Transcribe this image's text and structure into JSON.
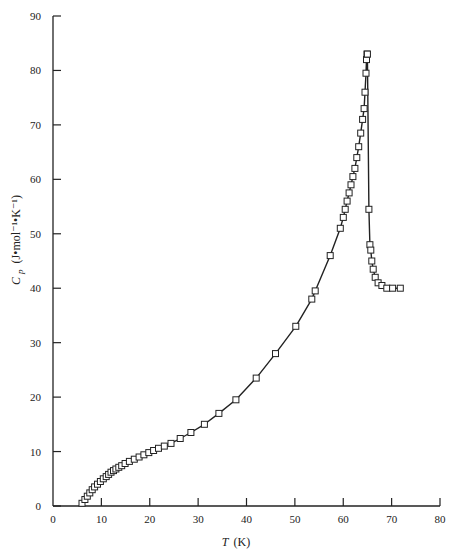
{
  "chart_data": {
    "type": "scatter",
    "title": "",
    "xlabel": "T (K)",
    "ylabel": "Cp (J•mol⁻¹•K⁻¹)",
    "xlim": [
      0,
      80
    ],
    "ylim": [
      0,
      90
    ],
    "xticks": [
      0,
      10,
      20,
      30,
      40,
      50,
      60,
      70,
      80
    ],
    "yticks": [
      0,
      10,
      20,
      30,
      40,
      50,
      60,
      70,
      80,
      90
    ],
    "grid": false,
    "legend": null,
    "marker": "open-square",
    "line": "smooth fitted curve through points",
    "series": [
      {
        "name": "Cp",
        "x": [
          6.0,
          6.6,
          7.1,
          7.6,
          8.1,
          8.6,
          9.2,
          9.8,
          10.4,
          11.0,
          11.5,
          12.0,
          12.5,
          13.0,
          13.6,
          14.2,
          14.9,
          15.8,
          16.8,
          17.8,
          18.8,
          19.8,
          20.8,
          21.8,
          23.0,
          24.4,
          26.3,
          28.5,
          31.3,
          34.3,
          37.8,
          42.0,
          46.0,
          50.2,
          53.5,
          54.2,
          57.3,
          59.4,
          60.0,
          60.4,
          60.8,
          61.2,
          61.6,
          62.0,
          62.4,
          62.8,
          63.2,
          63.6,
          64.0,
          64.3,
          64.5,
          64.7,
          64.8,
          64.9,
          65.0,
          65.3,
          65.5,
          65.7,
          65.9,
          66.2,
          66.6,
          67.2,
          68.0,
          69.0,
          70.2,
          71.8
        ],
        "y": [
          0.5,
          1.2,
          1.8,
          2.4,
          3.0,
          3.5,
          4.0,
          4.5,
          5.0,
          5.4,
          5.8,
          6.2,
          6.5,
          6.8,
          7.1,
          7.4,
          7.8,
          8.2,
          8.6,
          9.0,
          9.4,
          9.8,
          10.2,
          10.6,
          11.0,
          11.5,
          12.4,
          13.5,
          15.0,
          17.0,
          19.5,
          23.5,
          28.0,
          33.0,
          38.0,
          39.5,
          46.0,
          51.0,
          53.0,
          54.5,
          56.0,
          57.5,
          59.0,
          60.5,
          62.0,
          64.0,
          66.0,
          68.5,
          71.0,
          73.0,
          76.0,
          79.5,
          82.0,
          83.0,
          83.0,
          54.5,
          48.0,
          47.0,
          45.0,
          43.5,
          42.0,
          41.0,
          40.5,
          40.0,
          40.0,
          40.0
        ]
      }
    ],
    "annotations": []
  },
  "axes": {
    "x_label_italic": "T",
    "x_label_unit": "(K)",
    "y_label_symbol": "C",
    "y_label_subscript": "p",
    "y_label_unit": "(J•mol⁻¹•K⁻¹)"
  }
}
